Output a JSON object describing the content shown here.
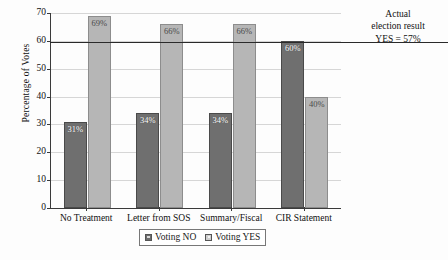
{
  "chart_data": {
    "type": "bar",
    "title": "",
    "xlabel": "",
    "ylabel": "Percentage of Votes",
    "categories": [
      "No Treatment",
      "Letter from SOS",
      "Summary/Fiscal",
      "CIR Statement"
    ],
    "series": [
      {
        "name": "Voting NO",
        "values": [
          31,
          34,
          34,
          60
        ],
        "labels": [
          "31%",
          "34%",
          "34%",
          "60%"
        ],
        "color": "#6f6f6f"
      },
      {
        "name": "Voting YES",
        "values": [
          69,
          66,
          66,
          40
        ],
        "labels": [
          "69%",
          "66%",
          "66%",
          "40%"
        ],
        "color": "#b6b6b6"
      }
    ],
    "ylim": [
      0,
      70
    ],
    "yticks": [
      0,
      10,
      20,
      30,
      40,
      50,
      60,
      70
    ],
    "ytick_labels": [
      "0",
      "10",
      "20",
      "30",
      "40",
      "50",
      "60",
      "70"
    ],
    "grid": true,
    "legend_position": "bottom-center",
    "reference_line": {
      "value": 57,
      "drawn_at": 59.5,
      "color": "#2a2a2a",
      "annotation_line1": "Actual",
      "annotation_line2": "election result",
      "annotation_line3": "YES = 57%"
    }
  },
  "legend": {
    "items": [
      {
        "label": "Voting NO"
      },
      {
        "label": "Voting YES"
      }
    ]
  },
  "colors": {
    "voting_no": "#6f6f6f",
    "voting_yes": "#b6b6b6",
    "axis": "#3a3a3a",
    "grid": "#d6d6d6",
    "reference_line": "#2a2a2a",
    "background": "#fdfdfd"
  }
}
